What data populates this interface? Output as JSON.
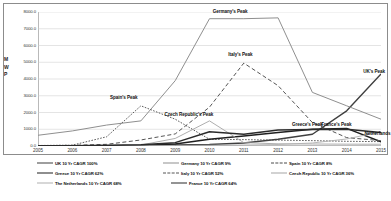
{
  "chart_data": {
    "type": "line",
    "title": "",
    "xlabel": "",
    "ylabel": "M W P",
    "ylim": [
      0,
      8000
    ],
    "xlim": [
      2005,
      2015
    ],
    "grid": true,
    "legend_position": "bottom",
    "categories": [
      "2005",
      "2006",
      "2007",
      "2008",
      "2009",
      "2010",
      "2011",
      "2012",
      "2013",
      "2014",
      "2015"
    ],
    "x": [
      2005,
      2006,
      2007,
      2008,
      2009,
      2010,
      2011,
      2012,
      2013,
      2014,
      2015
    ],
    "y_ticks": [
      "0.0",
      "1000.0",
      "2000.0",
      "3000.0",
      "4000.0",
      "5000.0",
      "6000.0",
      "7000.0",
      "8000.0"
    ],
    "series": [
      {
        "name": "UK",
        "legend": "UK 10 Yr CAGR 100%",
        "style": "solid",
        "color": "#3f3f3f",
        "width": 1.4,
        "values": [
          10,
          15,
          25,
          40,
          60,
          90,
          180,
          400,
          700,
          2100,
          4300
        ]
      },
      {
        "name": "Germany",
        "legend": "Germany 10 Yr CAGR 9%",
        "style": "solid",
        "color": "#8f8f8f",
        "width": 1.0,
        "values": [
          640,
          900,
          1250,
          1500,
          3900,
          7600,
          7600,
          7650,
          3200,
          2400,
          1600
        ]
      },
      {
        "name": "Spain",
        "legend": "Spain 10 Yr CAGR 8%",
        "style": "dashed-fine",
        "color": "#4a4a4a",
        "width": 0.9,
        "values": [
          30,
          50,
          550,
          2400,
          1600,
          400,
          380,
          350,
          320,
          280,
          260
        ]
      },
      {
        "name": "Greece",
        "legend": "Greece 10 Yr CAGR 62%",
        "style": "solid",
        "color": "#1f1f1f",
        "width": 1.5,
        "values": [
          10,
          15,
          20,
          35,
          120,
          400,
          600,
          800,
          1000,
          1050,
          250
        ]
      },
      {
        "name": "Italy",
        "legend": "Italy 10 Yr CAGR 52%",
        "style": "dashed",
        "color": "#555555",
        "width": 1.0,
        "values": [
          20,
          40,
          100,
          360,
          720,
          2320,
          4950,
          3600,
          1400,
          500,
          320
        ]
      },
      {
        "name": "Czech Republic",
        "legend": "Czech Republic 10 Yr CAGR 36%",
        "style": "solid",
        "color": "#a5a5a5",
        "width": 0.9,
        "values": [
          5,
          10,
          20,
          60,
          450,
          1500,
          200,
          130,
          120,
          110,
          105
        ]
      },
      {
        "name": "The Netherlands",
        "legend": "The Netherlands 10 Yr CAGR 68%",
        "style": "solid",
        "color": "#b0b0b0",
        "width": 0.9,
        "values": [
          5,
          8,
          12,
          20,
          30,
          45,
          60,
          90,
          180,
          420,
          850
        ]
      },
      {
        "name": "France",
        "legend": "France 10 Yr CAGR 64%",
        "style": "solid",
        "color": "#2b2b2b",
        "width": 1.5,
        "values": [
          10,
          20,
          40,
          70,
          200,
          850,
          700,
          950,
          980,
          1000,
          800
        ]
      }
    ],
    "annotations": [
      {
        "text": "Germany's Peak",
        "x": 2010.6,
        "y": 8050
      },
      {
        "text": "Italy's Peak",
        "x": 2010.9,
        "y": 5500
      },
      {
        "text": "Spain's Peak",
        "x": 2007.5,
        "y": 2950
      },
      {
        "text": "Czech Republic's Peak",
        "x": 2009.4,
        "y": 1900
      },
      {
        "text": "Greece's Peak",
        "x": 2012.85,
        "y": 1300
      },
      {
        "text": "France's Peak",
        "x": 2013.7,
        "y": 1300
      },
      {
        "text": "Netherlands",
        "x": 2014.9,
        "y": 800
      },
      {
        "text": "UK's Peak",
        "x": 2014.8,
        "y": 4500
      }
    ]
  }
}
